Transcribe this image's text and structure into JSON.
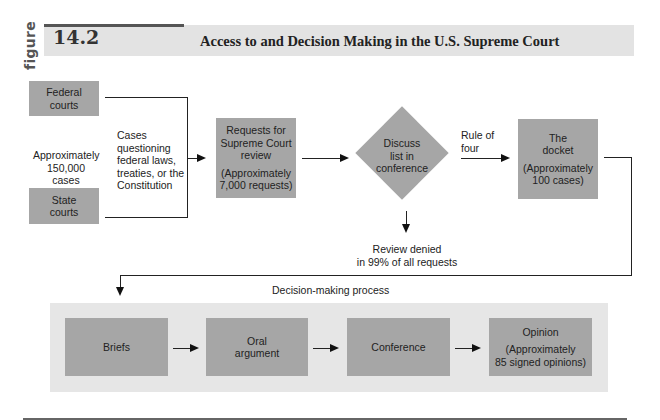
{
  "header": {
    "figure_word": "figure",
    "figure_number": "14.2",
    "title": "Access to and Decision Making in the U.S. Supreme Court"
  },
  "access": {
    "federal_courts": [
      "Federal",
      "courts"
    ],
    "state_courts": [
      "State",
      "courts"
    ],
    "lower_count": [
      "Approximately",
      "150,000 cases"
    ],
    "cases_note": [
      "Cases",
      "questioning",
      "federal laws,",
      "treaties, or the",
      "Constitution"
    ],
    "requests_box": {
      "title": [
        "Requests for",
        "Supreme Court",
        "review"
      ],
      "count": [
        "(Approximately",
        "7,000 requests)"
      ]
    },
    "discuss_diamond": [
      "Discuss",
      "list  in",
      "conference"
    ],
    "denied_note": [
      "Review denied",
      "in 99% of all requests"
    ],
    "rule_of_four": [
      "Rule of",
      "four"
    ],
    "docket_box": {
      "title": [
        "The",
        "docket"
      ],
      "count": [
        "(Approximately",
        "100 cases)"
      ]
    }
  },
  "decision": {
    "label": "Decision-making process",
    "steps": [
      {
        "label": [
          "Briefs"
        ]
      },
      {
        "label": [
          "Oral",
          "argument"
        ]
      },
      {
        "label": [
          "Conference"
        ]
      },
      {
        "label": [
          "Opinion"
        ],
        "count": [
          "(Approximately",
          "85 signed opinions)"
        ]
      }
    ]
  },
  "colors": {
    "box_fill": "#a6a6a6",
    "band_fill": "#e6e6e6",
    "header_fill": "#e3e3e3",
    "line": "#222222"
  }
}
